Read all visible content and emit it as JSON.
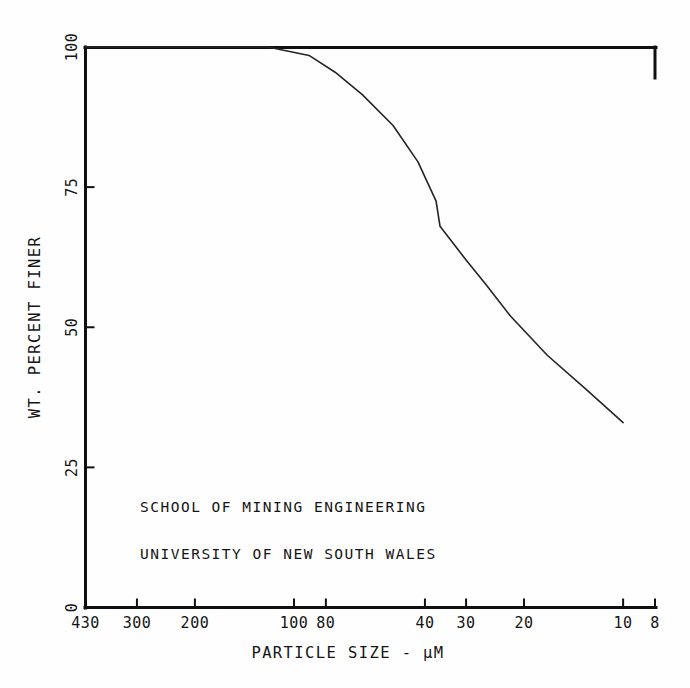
{
  "chart_data": {
    "type": "line",
    "title": "",
    "subtitle": "",
    "xlabel": "PARTICLE SIZE - µM",
    "ylabel": "WT. PERCENT FINER",
    "xscale": "log-reversed",
    "xlim": [
      430,
      8
    ],
    "ylim": [
      0,
      100
    ],
    "grid": false,
    "legend": null,
    "xticks": [
      430,
      300,
      200,
      100,
      80,
      40,
      30,
      20,
      10,
      8
    ],
    "xtick_labels": [
      "430",
      "300",
      "200",
      "100",
      "80",
      "40",
      "30",
      "20",
      "10",
      "8"
    ],
    "yticks": [
      0,
      25,
      50,
      75,
      100
    ],
    "ytick_labels": [
      "0",
      "25",
      "50",
      "75",
      "100"
    ],
    "series": [
      {
        "name": "Particle size distribution",
        "x": [
          430,
          120,
          90,
          75,
          62,
          50,
          42,
          37,
          36,
          30,
          26,
          22,
          17,
          13,
          10
        ],
        "values": [
          100,
          100,
          98.5,
          95.5,
          91.5,
          86,
          79.5,
          72.5,
          68,
          62,
          57.5,
          52,
          45,
          39,
          33
        ]
      }
    ],
    "annotations": [
      {
        "text": "SCHOOL OF MINING ENGINEERING",
        "x": 0.17,
        "y": 0.205
      },
      {
        "text": "UNIVERSITY OF NEW SOUTH WALES",
        "x": 0.17,
        "y": 0.125
      }
    ],
    "colors": {
      "curve": "#242424",
      "axis": "#101010",
      "background": "#fefefe",
      "text": "#141414"
    }
  }
}
